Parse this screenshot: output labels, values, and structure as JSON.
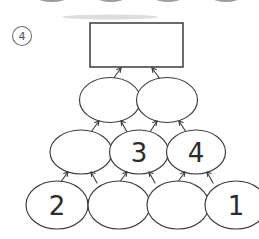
{
  "figure": {
    "tag_label": "4",
    "tag_name": "figure-number-badge"
  },
  "colors": {
    "ink": "#3a3a3c",
    "label_ink": "#2c2c2e",
    "tag_ink": "#55555a",
    "tag_stroke": "#6b6b70",
    "background": "#ffffff"
  },
  "top_box": {
    "label": "",
    "name": "answer-box"
  },
  "rows": [
    {
      "row_name": "row-2-ellipses",
      "nodes": [
        {
          "label": "",
          "name": "ellipse-r2-c1"
        },
        {
          "label": "",
          "name": "ellipse-r2-c2"
        }
      ]
    },
    {
      "row_name": "row-3-ellipses",
      "nodes": [
        {
          "label": "",
          "name": "ellipse-r3-c1"
        },
        {
          "label": "3",
          "name": "ellipse-r3-c2"
        },
        {
          "label": "4",
          "name": "ellipse-r3-c3"
        }
      ]
    },
    {
      "row_name": "row-4-ellipses",
      "nodes": [
        {
          "label": "2",
          "name": "ellipse-r4-c1"
        },
        {
          "label": "",
          "name": "ellipse-r4-c2"
        },
        {
          "label": "",
          "name": "ellipse-r4-c3"
        },
        {
          "label": "1",
          "name": "ellipse-r4-c4"
        }
      ]
    }
  ],
  "edges": {
    "name": "arrow-connectors",
    "row2_to_box_count": 2,
    "row3_to_row2_count": 4,
    "row4_to_row3_count": 6,
    "direction": "upward"
  }
}
